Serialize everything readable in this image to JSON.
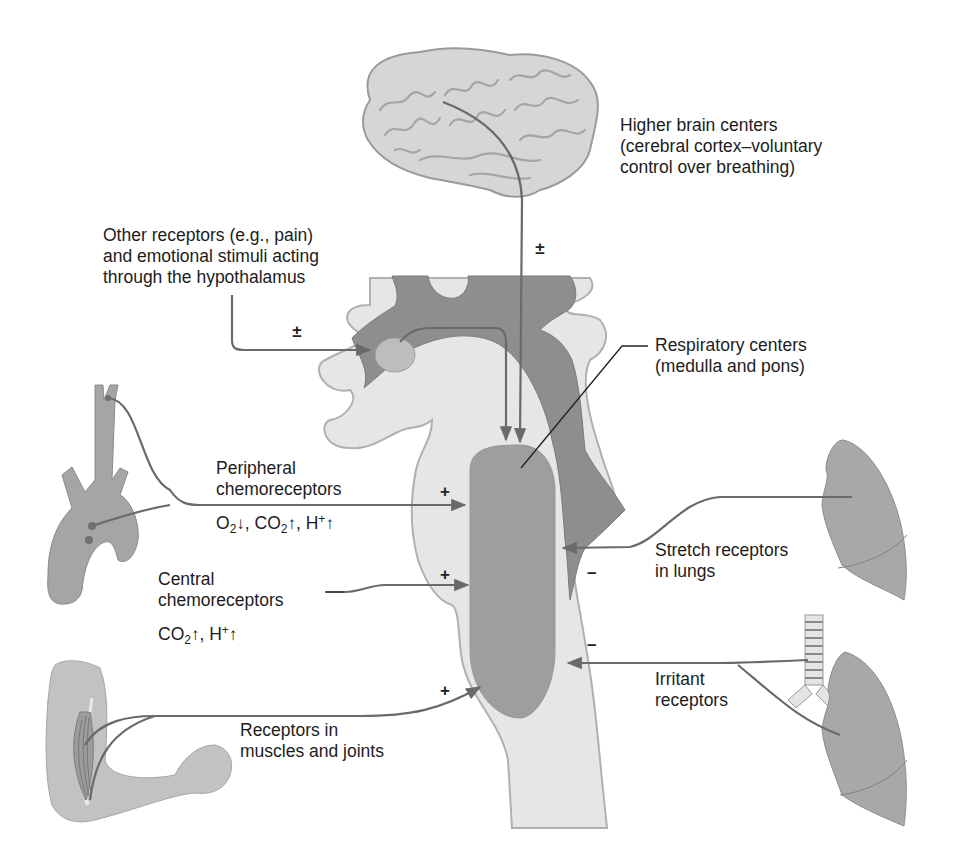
{
  "diagram": {
    "type": "physiology-schematic",
    "colors": {
      "background": "#ffffff",
      "tissue_light": "#e4e4e4",
      "tissue_dark": "#8e8e8e",
      "respiratory_center": "#9a9a9a",
      "organ_fill": "#a5a5a5",
      "pathway_line": "#6a6a6a",
      "text": "#1c1c1c"
    }
  },
  "labels": {
    "higher_brain": {
      "lines": [
        "Higher brain centers",
        "(cerebral cortex–voluntary",
        "control over breathing)"
      ],
      "sign": "±"
    },
    "hypothalamus": {
      "lines": [
        "Other receptors (e.g., pain)",
        "and emotional stimuli acting",
        "through the hypothalamus"
      ],
      "sign": "±"
    },
    "respiratory_centers": {
      "lines": [
        "Respiratory centers",
        "(medulla and pons)"
      ]
    },
    "peripheral_chemo": {
      "lines": [
        "Peripheral",
        "chemoreceptors"
      ],
      "stimuli": {
        "o2": "O",
        "o2_sub": "2",
        "o2_arrow": "↓",
        "sep1": ", ",
        "co2": "CO",
        "co2_sub": "2",
        "co2_arrow": "↑",
        "sep2": ", ",
        "h": "H",
        "h_sup": "+",
        "h_arrow": "↑"
      },
      "sign": "+"
    },
    "central_chemo": {
      "lines": [
        "Central",
        "chemoreceptors"
      ],
      "stimuli": {
        "co2": "CO",
        "co2_sub": "2",
        "co2_arrow": "↑",
        "sep": ", ",
        "h": "H",
        "h_sup": "+",
        "h_arrow": "↑"
      },
      "sign": "+"
    },
    "muscles_joints": {
      "lines": [
        "Receptors in",
        "muscles and joints"
      ],
      "sign": "+"
    },
    "stretch": {
      "lines": [
        "Stretch receptors",
        "in lungs"
      ],
      "sign": "–"
    },
    "irritant": {
      "lines": [
        "Irritant",
        "receptors"
      ],
      "sign": "–"
    }
  }
}
